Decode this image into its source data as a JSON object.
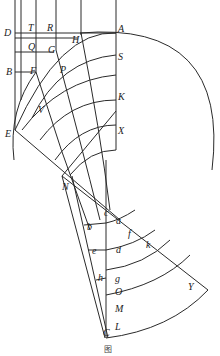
{
  "figure": {
    "caption": "图",
    "labels": {
      "D": "D",
      "T": "T",
      "R": "R",
      "H": "H",
      "A": "A",
      "Q": "Q",
      "G": "G",
      "S": "S",
      "B": "B",
      "F": "F",
      "P": "P",
      "V": "V",
      "K": "K",
      "E": "E",
      "X": "X",
      "N": "N",
      "c": "c",
      "a": "a",
      "b": "b",
      "f": "f",
      "e": "e",
      "d": "d",
      "k": "k",
      "h": "h",
      "g": "g",
      "O": "O",
      "M": "M",
      "Y": "Y",
      "L": "L",
      "C": "C"
    }
  }
}
